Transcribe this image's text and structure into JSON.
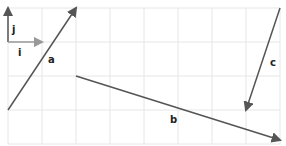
{
  "diagram": {
    "title": "",
    "grid": {
      "origin_x": 8,
      "origin_y": 8,
      "cell": 34,
      "cols": 8,
      "rows": 4,
      "color": "#e6e6e6"
    },
    "vectors": [
      {
        "id": "j",
        "label": "j",
        "from": [
          8,
          42
        ],
        "to": [
          8,
          8
        ],
        "color": "#555555",
        "label_pos": [
          12,
          33
        ]
      },
      {
        "id": "i",
        "label": "i",
        "from": [
          8,
          42
        ],
        "to": [
          42,
          42
        ],
        "color": "#999999",
        "label_pos": [
          18,
          56
        ]
      },
      {
        "id": "a",
        "label": "a",
        "from": [
          8,
          110
        ],
        "to": [
          76,
          8
        ],
        "color": "#555555",
        "label_pos": [
          48,
          63
        ]
      },
      {
        "id": "b",
        "label": "b",
        "from": [
          76,
          76
        ],
        "to": [
          280,
          140
        ],
        "color": "#555555",
        "label_pos": [
          170,
          123
        ]
      },
      {
        "id": "c",
        "label": "c",
        "from": [
          280,
          8
        ],
        "to": [
          246,
          110
        ],
        "color": "#555555",
        "label_pos": [
          270,
          66
        ]
      }
    ]
  }
}
